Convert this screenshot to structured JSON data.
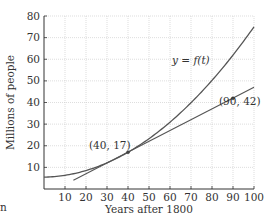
{
  "chart_data": {
    "type": "line",
    "title": "",
    "xlabel": "Years after 1800",
    "ylabel": "Millions of people",
    "xlim": [
      0,
      100
    ],
    "ylim": [
      0,
      80
    ],
    "xticks": [
      10,
      20,
      30,
      40,
      50,
      60,
      70,
      80,
      90,
      100
    ],
    "yticks": [
      10,
      20,
      30,
      40,
      50,
      60,
      70,
      80
    ],
    "grid": true,
    "series": [
      {
        "name": "y = f(t)",
        "kind": "curve",
        "x": [
          0,
          10,
          20,
          30,
          40,
          50,
          60,
          70,
          80,
          90,
          100
        ],
        "values": [
          5.5,
          6.3,
          8.0,
          10.6,
          17,
          23,
          32,
          40,
          50,
          62,
          75
        ]
      },
      {
        "name": "line through (40, 17) and (90, 42)",
        "kind": "line",
        "x": [
          14,
          100
        ],
        "values": [
          4,
          47
        ]
      }
    ],
    "annotations": [
      {
        "text": "y = f(t)",
        "x": 73,
        "y": 57
      },
      {
        "text": "(40, 17)",
        "x": 40,
        "y": 17,
        "marker": true
      },
      {
        "text": "(90, 42)",
        "x": 90,
        "y": 42,
        "marker": true
      }
    ]
  },
  "labels": {
    "xlabel": "Years after 1800",
    "ylabel": "Millions of people",
    "curve_label": "y = f(t)",
    "point1": "(40, 17)",
    "point2": "(90, 42)",
    "stray_glyph": "n"
  }
}
